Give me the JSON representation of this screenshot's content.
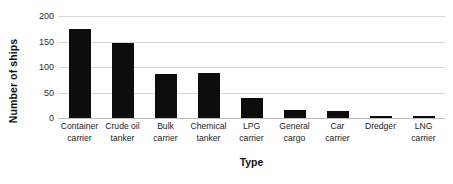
{
  "chart_data": {
    "type": "bar",
    "title": "",
    "xlabel": "Type",
    "ylabel": "Number of ships",
    "categories": [
      "Container carrier",
      "Crude oil tanker",
      "Bulk carrier",
      "Chemical tanker",
      "LPG carrier",
      "General cargo",
      "Car carrier",
      "Dredger",
      "LNG carrier"
    ],
    "category_lines": [
      [
        "Container",
        "carrier"
      ],
      [
        "Crude oil",
        "tanker"
      ],
      [
        "Bulk",
        "carrier"
      ],
      [
        "Chemical",
        "tanker"
      ],
      [
        "LPG",
        "carrier"
      ],
      [
        "General",
        "cargo"
      ],
      [
        "Car",
        "carrier"
      ],
      [
        "Dredger",
        ""
      ],
      [
        "LNG",
        "carrier"
      ]
    ],
    "values": [
      175,
      148,
      86,
      88,
      39,
      16,
      14,
      4,
      4
    ],
    "ylim": [
      0,
      200
    ],
    "yticks": [
      0,
      50,
      100,
      150,
      200
    ],
    "ytick_labels": [
      "0",
      "50",
      "100",
      "150",
      "200"
    ],
    "grid": true,
    "legend": false,
    "bar_color": "#0d0d0d",
    "gridline_color": "#d9d9d9",
    "background_color": "#ffffff"
  }
}
